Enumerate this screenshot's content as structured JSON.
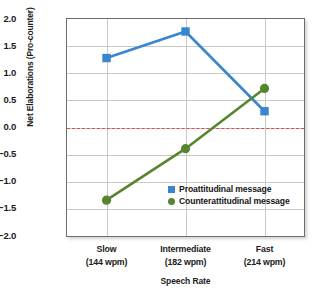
{
  "chart_data": {
    "type": "line",
    "title": "",
    "subtitle": "",
    "xlabel": "Speech Rate",
    "ylabel": "Net Elaborations (Pro-counter)",
    "categories": [
      "Slow\n(144 wpm)",
      "Intermediate\n(182 wpm)",
      "Fast\n(214 wpm)"
    ],
    "category_labels": [
      {
        "line1": "Slow",
        "line2": "(144 wpm)"
      },
      {
        "line1": "Intermediate",
        "line2": "(182 wpm)"
      },
      {
        "line1": "Fast",
        "line2": "(214 wpm)"
      }
    ],
    "series": [
      {
        "name": "Proattitudinal message",
        "values": [
          1.28,
          1.77,
          0.3
        ],
        "color": "#3a86ce",
        "marker": "square"
      },
      {
        "name": "Counterattitudinal message",
        "values": [
          -1.34,
          -0.39,
          0.72
        ],
        "color": "#55862f",
        "marker": "circle"
      }
    ],
    "ylim": [
      -2.0,
      2.0
    ],
    "yticks": [
      2.0,
      1.5,
      1.0,
      0.5,
      0.0,
      -0.5,
      -1.0,
      -1.5,
      -2.0
    ],
    "ytick_labels": [
      "2.0",
      "1.5",
      "1.0",
      "0.5",
      "0.0",
      "−0.5",
      "−1.0",
      "−1.5",
      "−2.0"
    ],
    "grid": true,
    "legend_position": "inside-lower-right",
    "reference_line": {
      "value": 0.0,
      "style": "dashed",
      "color": "#e0484b"
    }
  },
  "legend": {
    "items": [
      {
        "label": "Proattitudinal message",
        "color": "#3a86ce",
        "marker": "square"
      },
      {
        "label": "Counterattitudinal message",
        "color": "#55862f",
        "marker": "circle"
      }
    ]
  }
}
